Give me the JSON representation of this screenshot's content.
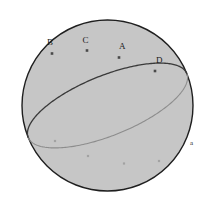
{
  "figure": {
    "name": "sphere-great-circle-diagram",
    "background_color": "#ffffff",
    "canvas": {
      "width": 211,
      "height": 213
    }
  },
  "sphere": {
    "name": "sphere-outline",
    "center": {
      "x": 107.5,
      "y": 105.5
    },
    "radius": 85.5,
    "fill_color": "#c6c6c6",
    "stroke_color": "#1f1f1f",
    "stroke_width": 1.4
  },
  "great_circle": {
    "name": "great-circle",
    "center": {
      "x": 107.5,
      "y": 105.5
    },
    "semi_major": 85.5,
    "semi_minor": 30.0,
    "rotation_deg": -22,
    "front_arc": {
      "label": "front-arc",
      "stroke_color": "#3a3a3a",
      "stroke_width": 1.3
    },
    "back_arc": {
      "label": "back-arc",
      "stroke_color": "#8d8d8d",
      "stroke_width": 1.1
    }
  },
  "front_points": [
    {
      "id": "B",
      "label": "B",
      "marker": {
        "x": 52.0,
        "y": 53.5
      },
      "label_pos": {
        "x": 47.0,
        "y": 38.0
      }
    },
    {
      "id": "C",
      "label": "C",
      "marker": {
        "x": 87.0,
        "y": 50.5
      },
      "label_pos": {
        "x": 82.5,
        "y": 36.0
      }
    },
    {
      "id": "A",
      "label": "A",
      "marker": {
        "x": 119.0,
        "y": 57.5
      },
      "label_pos": {
        "x": 119.0,
        "y": 42.0
      }
    },
    {
      "id": "D",
      "label": "D",
      "marker": {
        "x": 155.0,
        "y": 71.0
      },
      "label_pos": {
        "x": 156.0,
        "y": 56.0
      }
    }
  ],
  "front_point_style": {
    "fill_color": "#4a4a4a",
    "size": 2.6
  },
  "back_points": [
    {
      "id": "b1",
      "marker": {
        "x": 55.0,
        "y": 141.0
      }
    },
    {
      "id": "b2",
      "marker": {
        "x": 88.0,
        "y": 156.0
      }
    },
    {
      "id": "b3",
      "marker": {
        "x": 124.0,
        "y": 163.5
      }
    },
    {
      "id": "b4",
      "marker": {
        "x": 159.0,
        "y": 161.0
      }
    }
  ],
  "back_point_style": {
    "fill_color": "#a2a2a2",
    "size": 2.2
  },
  "axis_labels": [
    {
      "id": "a",
      "label": "a",
      "pos": {
        "x": 190.0,
        "y": 140.0
      }
    }
  ]
}
